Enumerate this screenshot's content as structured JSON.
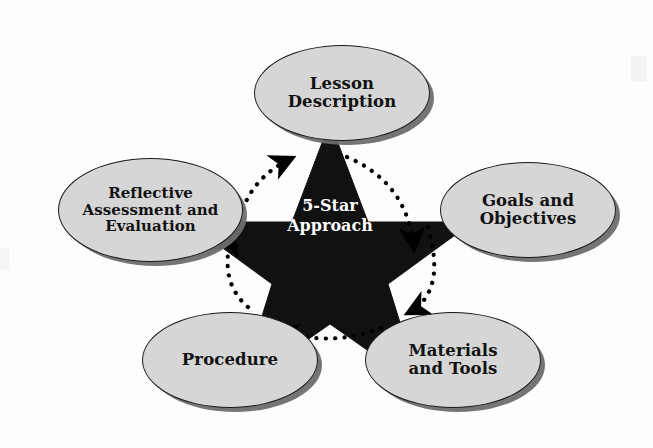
{
  "diagram": {
    "title": "5-Star Approach",
    "center": {
      "line1": "5-Star",
      "line2": "Approach",
      "shape": "five-pointed-star",
      "fill_color": "#111111",
      "text_color": "#ffffff"
    },
    "node_style": {
      "fill_color": "#d6d6d6",
      "border_color": "#1a1a1a",
      "shadow_color": "#6e6e6e",
      "text_color": "#111111"
    },
    "arrow_style": {
      "style": "dotted-arc",
      "color": "#000000",
      "direction": "clockwise"
    },
    "nodes": [
      {
        "id": "lesson",
        "position": "top",
        "lines": [
          "Lesson",
          "Description"
        ],
        "text": "Lesson Description"
      },
      {
        "id": "goals",
        "position": "right",
        "lines": [
          "Goals and",
          "Objectives"
        ],
        "text": "Goals and Objectives"
      },
      {
        "id": "materials",
        "position": "bottom-right",
        "lines": [
          "Materials",
          "and Tools"
        ],
        "text": "Materials and Tools"
      },
      {
        "id": "procedure",
        "position": "bottom-left",
        "lines": [
          "Procedure"
        ],
        "text": "Procedure"
      },
      {
        "id": "reflective",
        "position": "left",
        "lines": [
          "Reflective",
          "Assessment and",
          "Evaluation"
        ],
        "text": "Reflective Assessment and Evaluation"
      }
    ],
    "arrows": [
      {
        "id": "arrow-reflective-to-lesson",
        "from": "reflective",
        "to": "lesson"
      },
      {
        "id": "arrow-lesson-to-goals",
        "from": "lesson",
        "to": "goals"
      },
      {
        "id": "arrow-goals-to-materials",
        "from": "goals",
        "to": "materials"
      },
      {
        "id": "arrow-materials-to-procedure",
        "from": "materials",
        "to": "procedure"
      },
      {
        "id": "arrow-procedure-to-reflective",
        "from": "procedure",
        "to": "reflective"
      }
    ]
  },
  "background": {
    "ghost_line1": "",
    "ghost_line2": "",
    "ghost_mid": ""
  }
}
